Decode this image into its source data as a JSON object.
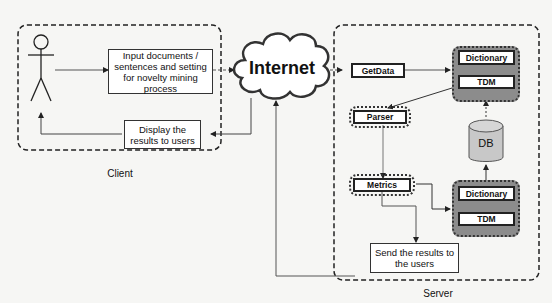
{
  "diagram": {
    "client": {
      "caption": "Client",
      "input_box": "Input documents / sentences and setting for novelty mining process",
      "display_box": "Display the results to users",
      "actor": "user-stick-figure"
    },
    "internet": {
      "label": "Internet"
    },
    "server": {
      "caption": "Server",
      "getdata": "GetData",
      "parser": "Parser",
      "metrics": "Metrics",
      "send_box": "Send the results to the users",
      "db": "DB",
      "store_top": {
        "dictionary": "Dictionary",
        "tdm": "TDM"
      },
      "store_bottom": {
        "dictionary": "Dictionary",
        "tdm": "TDM"
      }
    },
    "colors": {
      "background": "#f6f6f4",
      "store_group": "#8c8c8c",
      "db_fill": "#c8c8c8",
      "line": "#333333"
    }
  }
}
